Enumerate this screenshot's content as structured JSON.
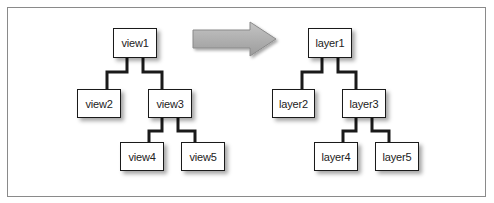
{
  "diagram": {
    "type": "tree-mapping",
    "arrow": {
      "direction": "right",
      "color": "#a9a9a9"
    },
    "left_tree": {
      "nodes": [
        {
          "id": "view1",
          "label": "view1"
        },
        {
          "id": "view2",
          "label": "view2"
        },
        {
          "id": "view3",
          "label": "view3"
        },
        {
          "id": "view4",
          "label": "view4"
        },
        {
          "id": "view5",
          "label": "view5"
        }
      ],
      "edges": [
        [
          "view1",
          "view2"
        ],
        [
          "view1",
          "view3"
        ],
        [
          "view3",
          "view4"
        ],
        [
          "view3",
          "view5"
        ]
      ]
    },
    "right_tree": {
      "nodes": [
        {
          "id": "layer1",
          "label": "layer1"
        },
        {
          "id": "layer2",
          "label": "layer2"
        },
        {
          "id": "layer3",
          "label": "layer3"
        },
        {
          "id": "layer4",
          "label": "layer4"
        },
        {
          "id": "layer5",
          "label": "layer5"
        }
      ],
      "edges": [
        [
          "layer1",
          "layer2"
        ],
        [
          "layer1",
          "layer3"
        ],
        [
          "layer3",
          "layer4"
        ],
        [
          "layer3",
          "layer5"
        ]
      ]
    }
  }
}
